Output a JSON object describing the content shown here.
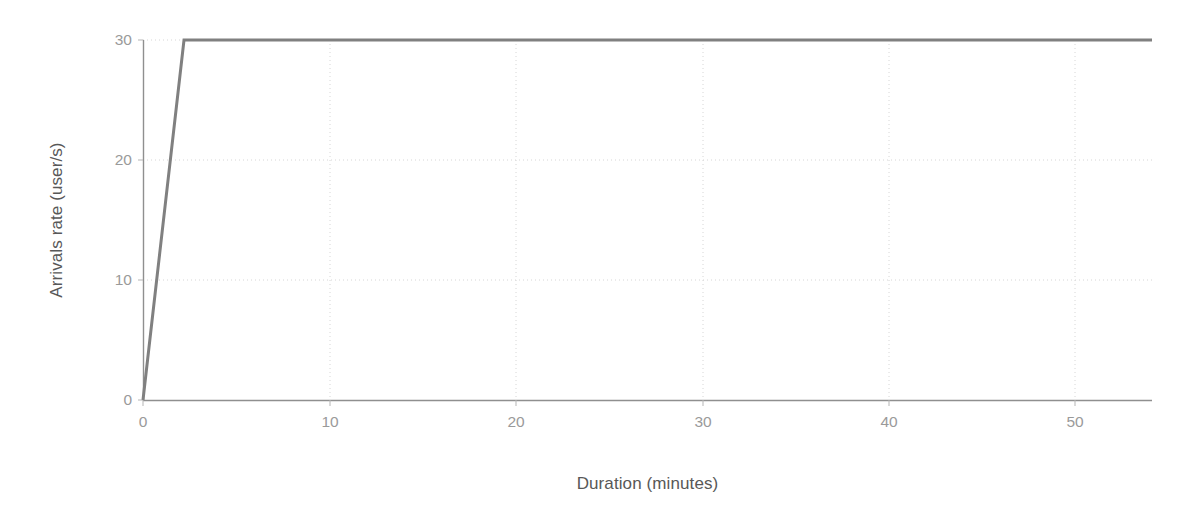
{
  "chart_data": {
    "type": "line",
    "title": "",
    "xlabel": "Duration (minutes)",
    "ylabel": "Arrivals rate (user/s)",
    "xlim": [
      0,
      54.1
    ],
    "ylim": [
      0,
      30
    ],
    "xticks": [
      0,
      10,
      20,
      30,
      40,
      50
    ],
    "xtick_labels": [
      "0",
      "10",
      "20",
      "30",
      "40",
      "50"
    ],
    "yticks": [
      0,
      10,
      20,
      30
    ],
    "ytick_labels": [
      "0",
      "10",
      "20",
      "30"
    ],
    "grid": true,
    "grid_style": "dotted",
    "legend": false,
    "legend_position": "none",
    "series": [
      {
        "name": "Arrivals rate",
        "color": "#808080",
        "line_width": 3,
        "x": [
          0,
          2.2,
          54.1
        ],
        "values": [
          0,
          30,
          30
        ]
      }
    ],
    "annotations": []
  },
  "colors": {
    "background": "#ffffff",
    "line": "#808080",
    "axis_spine": "#8f8f8f",
    "grid": "#d6d6d6",
    "tick_label": "#9a9a9a",
    "axis_title": "#585858"
  }
}
